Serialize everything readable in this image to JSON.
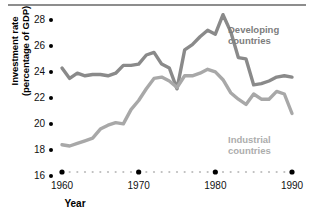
{
  "figure": {
    "has_top_rule": true,
    "background": "#ffffff"
  },
  "axes": {
    "y_title_line1": "Investment rate",
    "y_title_line2": "(percentage of GDP)",
    "x_title": "Year",
    "y_ticks": [
      "16",
      "18",
      "20",
      "22",
      "24",
      "26",
      "28"
    ],
    "x_ticks_major": [
      "1960",
      "1970",
      "1980",
      "1990"
    ]
  },
  "legend": {
    "developing": "Developing\ncountries",
    "developing_line1": "Developing",
    "developing_line2": "countries",
    "industrial_line1": "Industrial",
    "industrial_line2": "countries",
    "developing_color": "#7d7d7d",
    "industrial_color": "#adadad"
  },
  "chart_data": {
    "type": "line",
    "title": "",
    "xlabel": "Year",
    "ylabel": "Investment rate (percentage of GDP)",
    "xlim": [
      1959,
      1991
    ],
    "ylim": [
      16,
      29
    ],
    "ytick_values": [
      16,
      18,
      20,
      22,
      24,
      26,
      28
    ],
    "xtick_values": [
      1960,
      1970,
      1980,
      1990
    ],
    "grid": false,
    "legend_position": "inline-annotation",
    "x": [
      1960,
      1961,
      1962,
      1963,
      1964,
      1965,
      1966,
      1967,
      1968,
      1969,
      1970,
      1971,
      1972,
      1973,
      1974,
      1975,
      1976,
      1977,
      1978,
      1979,
      1980,
      1981,
      1982,
      1983,
      1984,
      1985,
      1986,
      1987,
      1988,
      1989,
      1990
    ],
    "series": [
      {
        "name": "Developing countries",
        "color": "#8a8a8a",
        "values": [
          24.0,
          23.2,
          23.6,
          23.4,
          23.5,
          23.5,
          23.4,
          23.6,
          24.2,
          24.2,
          24.3,
          25.0,
          25.2,
          24.3,
          24.0,
          22.4,
          25.4,
          25.8,
          26.4,
          26.9,
          26.6,
          28.1,
          26.8,
          24.8,
          24.7,
          22.7,
          22.8,
          23.0,
          23.3,
          23.4,
          23.3
        ]
      },
      {
        "name": "Industrial countries",
        "color": "#a8a8a8",
        "values": [
          18.1,
          18.0,
          18.2,
          18.4,
          18.6,
          19.3,
          19.6,
          19.8,
          19.7,
          20.8,
          21.5,
          22.4,
          23.2,
          23.3,
          23.0,
          22.5,
          23.4,
          23.4,
          23.6,
          23.9,
          23.7,
          23.1,
          22.1,
          21.6,
          21.2,
          22.0,
          21.6,
          21.6,
          22.2,
          22.0,
          20.5
        ]
      }
    ]
  }
}
